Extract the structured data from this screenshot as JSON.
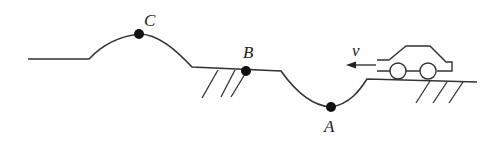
{
  "diagram": {
    "labels": {
      "A": "A",
      "B": "B",
      "C": "C",
      "velocity": "v"
    },
    "points": [
      {
        "name": "A",
        "role": "valley bottom"
      },
      {
        "name": "B",
        "role": "flat section"
      },
      {
        "name": "C",
        "role": "hill crest"
      }
    ],
    "colors": {
      "line": "#333333",
      "dot": "#111111",
      "background": "#ffffff"
    }
  }
}
